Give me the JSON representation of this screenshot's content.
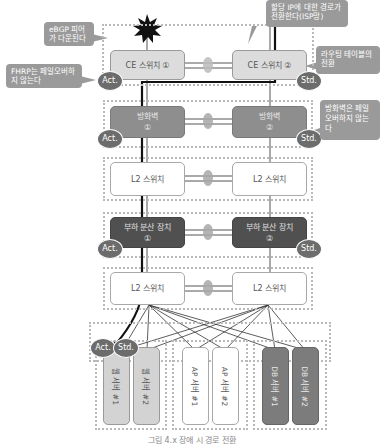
{
  "callouts": {
    "ebgp_down": "eBGP 피어가 다운된다",
    "fhrp_no_failover": "FHRP는 페일오버하지 않는다",
    "route_switch_isp": "할당 IP에 대한 경로가 전환한다(ISP망)",
    "routing_table_switch": "라우팅 테이블의 전환",
    "firewall_no_failover": "방화벽은 페일오버하지 않는다"
  },
  "devices": {
    "ce1": {
      "line1": "CE 스위치 ①",
      "line2": ""
    },
    "ce2": {
      "line1": "CE 스위치 ②",
      "line2": ""
    },
    "fw1": {
      "line1": "방화벽",
      "line2": "①"
    },
    "fw2": {
      "line1": "방화벽",
      "line2": "②"
    },
    "l2a1": {
      "line1": "L2 스위치"
    },
    "l2a2": {
      "line1": "L2 스위치"
    },
    "lb1": {
      "line1": "부하 분산 장치",
      "line2": "①"
    },
    "lb2": {
      "line1": "부하 분산 장치",
      "line2": "②"
    },
    "l2b1": {
      "line1": "L2 스위치"
    },
    "l2b2": {
      "line1": "L2 스위치"
    }
  },
  "badges": {
    "act": "Act.",
    "std": "Std."
  },
  "servers": [
    {
      "label": "웹 서버 #1",
      "type": "web"
    },
    {
      "label": "웹 서버 #2",
      "type": "web"
    },
    {
      "label": "AP 서버 #1",
      "type": "ap"
    },
    {
      "label": "AP 서버 #2",
      "type": "ap"
    },
    {
      "label": "DB 서버 #1",
      "type": "db"
    },
    {
      "label": "DB 서버 #2",
      "type": "db"
    }
  ],
  "colors": {
    "ce_fill": "#dcdcdc",
    "firewall_fill": "#8e8e8e",
    "loadbalancer_fill": "#505050",
    "l2_fill": "#ffffff",
    "badge_fill": "#6c6c6c",
    "callout_fill": "#9a9a9a",
    "traffic_path": "#111111"
  },
  "caption": "그림 4.x 장애 시 경로 전환"
}
